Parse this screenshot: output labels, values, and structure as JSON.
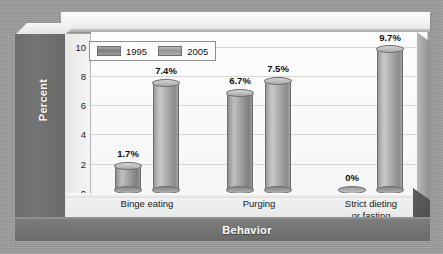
{
  "chart_data": {
    "type": "bar",
    "title": "",
    "subtitle": "",
    "xlabel": "Behavior",
    "ylabel": "Percent",
    "categories": [
      "Binge eating",
      "Purging",
      "Strict dieting or fasting"
    ],
    "category_lines": [
      [
        "Binge eating"
      ],
      [
        "Purging"
      ],
      [
        "Strict dieting",
        "or fasting"
      ]
    ],
    "series": [
      {
        "name": "1995",
        "values": [
          1.7,
          6.7,
          0
        ],
        "labels": [
          "1.7%",
          "6.7%",
          "0%"
        ],
        "color": "#8d8d8d"
      },
      {
        "name": "2005",
        "values": [
          7.4,
          7.5,
          9.7
        ],
        "labels": [
          "7.4%",
          "7.5%",
          "9.7%"
        ],
        "color": "#a6a6a6"
      }
    ],
    "ylim": [
      0,
      11
    ],
    "yticks": [
      0,
      2,
      4,
      6,
      8,
      10
    ],
    "ytick_labels": [
      "0",
      "2",
      "4",
      "6",
      "8",
      "10"
    ],
    "grid": true,
    "legend_position": "top-left",
    "style_3d": true
  },
  "legend": {
    "entries": [
      {
        "label": "1995"
      },
      {
        "label": "2005"
      }
    ]
  },
  "axes": {
    "y_title": "Percent",
    "x_title": "Behavior"
  },
  "colors": {
    "background": "#9d9d9d",
    "plot_background": "#fbfbfb",
    "wall": "#6e6e6e",
    "axis_band": "#737373",
    "gridline": "#d6d6d6",
    "text": "#141414",
    "label_text": "#ffffff"
  }
}
